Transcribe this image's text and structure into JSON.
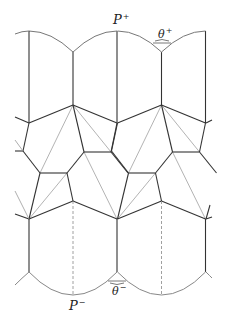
{
  "diagram": {
    "labels": {
      "p_plus": {
        "base": "P",
        "sup": "+"
      },
      "theta_plus": {
        "base": "θ",
        "sup": "+"
      },
      "p_minus": {
        "base": "P",
        "sup": "−"
      },
      "theta_minus": {
        "base": "θ",
        "sup": "−"
      }
    },
    "colors": {
      "dark_edge": "#333333",
      "light_edge": "#9a9a9a",
      "arc": "#777777",
      "dashed": "#888888"
    },
    "period_x": 88.5
  }
}
